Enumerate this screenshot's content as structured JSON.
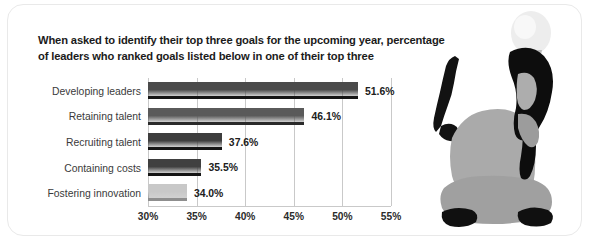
{
  "chart_data": {
    "type": "bar",
    "orientation": "horizontal",
    "title": "When asked to identify their top three goals for the upcoming year, percentage of leaders who ranked goals listed below in one of their top three",
    "title_lines": [
      "When asked to identify their top three goals for the upcoming year, percentage",
      "of leaders who ranked goals listed below in one of their top three"
    ],
    "categories": [
      "Developing leaders",
      "Retaining talent",
      "Recruiting talent",
      "Containing costs",
      "Fostering innovation"
    ],
    "values": [
      51.6,
      46.1,
      37.6,
      35.5,
      34.0
    ],
    "value_labels": [
      "51.6%",
      "46.1%",
      "37.6%",
      "35.5%",
      "34.0%"
    ],
    "bar_colors": [
      "#4a4a4a",
      "#5a5a5a",
      "#3d3d3d",
      "#404040",
      "#c8c8c8"
    ],
    "xlabel": "",
    "ylabel": "",
    "xlim": [
      30,
      55
    ],
    "xticks": [
      30,
      35,
      40,
      45,
      50,
      55
    ],
    "xtick_labels": [
      "30%",
      "35%",
      "40%",
      "45%",
      "50%",
      "55%"
    ],
    "grid": true,
    "grid_axis": "x",
    "legend": false,
    "legend_position": "none"
  },
  "illustration": {
    "bulb_name": "lightbulb-icon",
    "person_name": "seated-person-silhouette",
    "bulb_color": "#ededed",
    "bulb_base_color": "#b8b8b8",
    "body_color": "#a8a8a8",
    "body_dark_color": "#9a9a9a",
    "hair_color": "#0d0d0d"
  }
}
